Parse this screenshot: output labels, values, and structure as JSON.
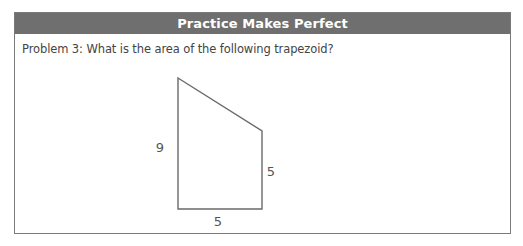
{
  "box": {
    "title": "Practice Makes Perfect",
    "header_color": "#6f6f6f",
    "border_color": "#7a7a7a"
  },
  "problem": {
    "text": "Problem 3: What is the area of the following trapezoid?"
  },
  "figure": {
    "shape": "right trapezoid",
    "labels": {
      "left_side": "9",
      "right_side": "5",
      "bottom_side": "5"
    },
    "stroke_color": "#6a6a6a"
  }
}
